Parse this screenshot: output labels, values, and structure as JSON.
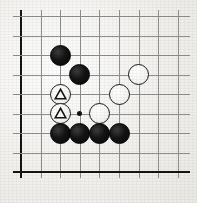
{
  "board": {
    "title": "Go board diagram",
    "type": "go-board",
    "visible_columns": 9,
    "visible_rows": 9,
    "origin_x": 21,
    "origin_y": 16,
    "spacing_x": 19.6,
    "spacing_y": 19.5,
    "line_color": "#8f8f8f",
    "edge_color": "#141414",
    "background_color": "#f3f2ef",
    "edges": {
      "left_border": true,
      "bottom_border": true,
      "top_border": false,
      "right_border": false
    },
    "star_points": [
      {
        "col": 4,
        "row": 6,
        "label": "star-point"
      }
    ],
    "stones": [
      {
        "id": "b1",
        "color": "black",
        "col": 3,
        "row": 3,
        "marker": "none",
        "label": "black-stone"
      },
      {
        "id": "b2",
        "color": "black",
        "col": 4,
        "row": 4,
        "marker": "none",
        "label": "black-stone"
      },
      {
        "id": "w1",
        "color": "white",
        "col": 3,
        "row": 5,
        "marker": "triangle",
        "label": "white-stone-marked"
      },
      {
        "id": "w2",
        "color": "white",
        "col": 3,
        "row": 6,
        "marker": "triangle",
        "label": "white-stone-marked"
      },
      {
        "id": "w3",
        "color": "white",
        "col": 5,
        "row": 6,
        "marker": "none",
        "label": "white-stone"
      },
      {
        "id": "w4",
        "color": "white",
        "col": 6,
        "row": 5,
        "marker": "none",
        "label": "white-stone"
      },
      {
        "id": "w5",
        "color": "white",
        "col": 7,
        "row": 4,
        "marker": "none",
        "label": "white-stone"
      },
      {
        "id": "b3",
        "color": "black",
        "col": 3,
        "row": 7,
        "marker": "none",
        "label": "black-stone"
      },
      {
        "id": "b4",
        "color": "black",
        "col": 4,
        "row": 7,
        "marker": "none",
        "label": "black-stone"
      },
      {
        "id": "b5",
        "color": "black",
        "col": 5,
        "row": 7,
        "marker": "none",
        "label": "black-stone"
      },
      {
        "id": "b6",
        "color": "black",
        "col": 6,
        "row": 7,
        "marker": "none",
        "label": "black-stone"
      }
    ],
    "stone_radius": 10.5,
    "marker_glyph": "triangle"
  }
}
